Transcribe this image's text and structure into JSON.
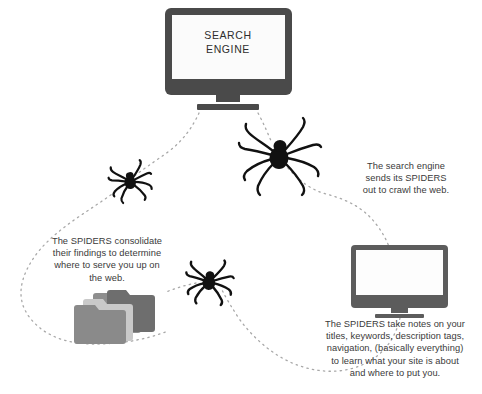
{
  "diagram": {
    "background_color": "#ffffff",
    "line_color": "#a8a8a8",
    "spider_color": "#111111",
    "text_color": "#3a3a3a"
  },
  "search_engine_monitor": {
    "screen_label_line1": "SEARCH",
    "screen_label_line2": "ENGINE",
    "bezel_color": "#4a4a4a",
    "screen_color": "#fbfbfb"
  },
  "website_monitor": {
    "bezel_color": "#5c5c5c",
    "screen_color": "#fdfdfd"
  },
  "folder_stack": {
    "count": 4,
    "colors": [
      "#8e8e8e",
      "#6e6e6e",
      "#c9c9c9",
      "#8a8a8a"
    ]
  },
  "spiders": [
    {
      "name": "spider-large",
      "size": "large"
    },
    {
      "name": "spider-left",
      "size": "small"
    },
    {
      "name": "spider-center",
      "size": "small"
    }
  ],
  "captions": {
    "crawl": "The search engine\nsends its SPIDERS\nout to crawl the web.",
    "consolidate": "The SPIDERS consolidate\ntheir findings to determine\nwhere to serve you up on\nthe web.",
    "notes": "The SPIDERS take notes on your\ntitles, keywords, description tags,\nnavigation, (basically everything)\nto learn what your site is about\nand where to put you."
  }
}
